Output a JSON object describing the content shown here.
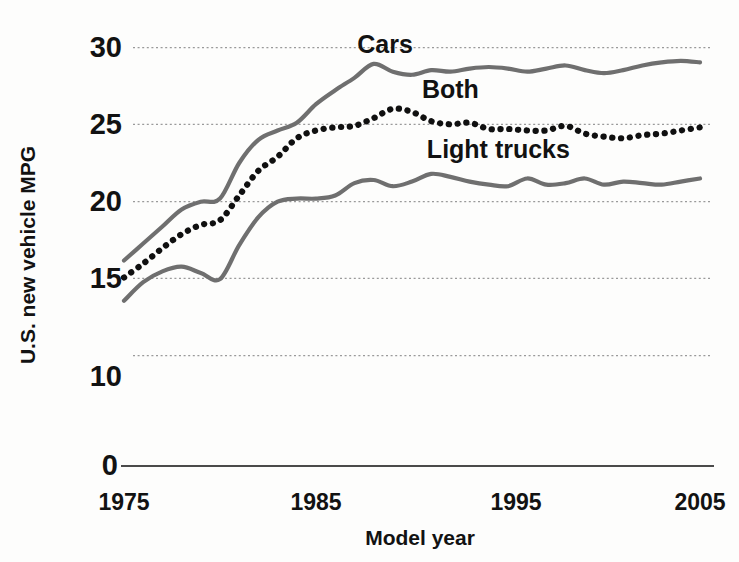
{
  "chart_data": {
    "type": "line",
    "title": "",
    "xlabel": "Model year",
    "ylabel": "U.S. new vehicle MPG",
    "xlim": [
      1975,
      2005
    ],
    "ylim": [
      10,
      30
    ],
    "y_axis_break_at_zero": true,
    "grid": true,
    "legend_position": "inline-annotations",
    "y_ticks": [
      "30",
      "25",
      "20",
      "15",
      "10",
      "0"
    ],
    "x_ticks": [
      "1975",
      "1985",
      "1995",
      "2005"
    ],
    "x": [
      1975,
      1976,
      1977,
      1978,
      1979,
      1980,
      1981,
      1982,
      1983,
      1984,
      1985,
      1986,
      1987,
      1988,
      1989,
      1990,
      1991,
      1992,
      1993,
      1994,
      1995,
      1996,
      1997,
      1998,
      1999,
      2000,
      2001,
      2002,
      2003,
      2004,
      2005
    ],
    "series": [
      {
        "name": "Cars",
        "style": "solid-gray",
        "color": "#6f6f6f",
        "label_position": {
          "x": 1988.6,
          "y": 29.6
        },
        "values": [
          16.2,
          17.3,
          18.4,
          19.5,
          20.0,
          20.2,
          22.5,
          24.0,
          24.6,
          25.1,
          26.3,
          27.2,
          28.0,
          28.9,
          28.4,
          28.2,
          28.5,
          28.4,
          28.6,
          28.7,
          28.6,
          28.4,
          28.6,
          28.8,
          28.5,
          28.3,
          28.5,
          28.8,
          29.0,
          29.1,
          29.0
        ]
      },
      {
        "name": "Both",
        "style": "dotted-black",
        "color": "#101010",
        "label_position": {
          "x": 1992.0,
          "y": 26.7
        },
        "values": [
          15.1,
          16.0,
          17.0,
          17.9,
          18.5,
          18.8,
          20.4,
          22.0,
          22.9,
          24.1,
          24.6,
          24.8,
          24.9,
          25.4,
          26.0,
          25.8,
          25.2,
          25.0,
          25.1,
          24.7,
          24.7,
          24.6,
          24.6,
          24.9,
          24.4,
          24.2,
          24.1,
          24.3,
          24.4,
          24.6,
          24.8
        ]
      },
      {
        "name": "Light trucks",
        "style": "solid-gray",
        "color": "#6f6f6f",
        "label_position": {
          "x": 1994.5,
          "y": 22.8
        },
        "values": [
          13.6,
          14.8,
          15.5,
          15.8,
          15.4,
          15.0,
          17.2,
          19.0,
          20.0,
          20.2,
          20.2,
          20.4,
          21.2,
          21.4,
          21.0,
          21.3,
          21.8,
          21.6,
          21.3,
          21.1,
          21.0,
          21.5,
          21.1,
          21.2,
          21.5,
          21.1,
          21.3,
          21.2,
          21.1,
          21.3,
          21.5
        ]
      }
    ],
    "annotations": [
      {
        "text": "Cars"
      },
      {
        "text": "Both"
      },
      {
        "text": "Light trucks"
      }
    ]
  },
  "axes": {
    "y_label": "U.S. new vehicle MPG",
    "x_label": "Model year",
    "y_ticks": [
      {
        "label": "30",
        "value": 30
      },
      {
        "label": "25",
        "value": 25
      },
      {
        "label": "20",
        "value": 20
      },
      {
        "label": "15",
        "value": 15
      },
      {
        "label": "10",
        "value": 10
      },
      {
        "label": "0",
        "value": 0
      }
    ],
    "x_ticks": [
      {
        "label": "1975",
        "value": 1975
      },
      {
        "label": "1985",
        "value": 1985
      },
      {
        "label": "1995",
        "value": 1995
      },
      {
        "label": "2005",
        "value": 2005
      }
    ]
  },
  "labels": {
    "cars": "Cars",
    "both": "Both",
    "light_trucks": "Light trucks"
  },
  "colors": {
    "solid_series": "#6f6f6f",
    "dotted_series": "#101010",
    "gridline": "#9a9a9a",
    "baseline": "#4a4a4a",
    "text": "#121212",
    "background": "#fdfdfc"
  }
}
